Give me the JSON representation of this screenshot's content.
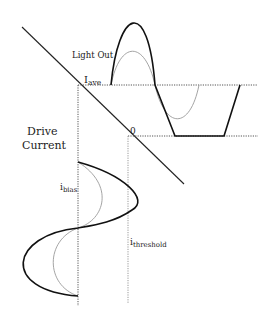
{
  "diagram": {
    "labels": {
      "light_out": "Light Out",
      "drive_current_line1": "Drive",
      "drive_current_line2": "Current",
      "i_ave_main": "I",
      "i_ave_sub": "ave",
      "zero": "0",
      "i_bias_main": "i",
      "i_bias_sub": "bias",
      "i_threshold_main": "i",
      "i_threshold_sub": "threshold"
    },
    "elements": [
      "transfer-curve (diagonal L-I characteristic)",
      "light-output waveform (clipped, bold)",
      "light-output waveform (small, thin gray)",
      "drive-current waveform (large, bold)",
      "drive-current waveform (small, thin gray)",
      "I_ave dotted horizontal reference",
      "zero-light dotted horizontal reference",
      "i_bias dotted vertical reference",
      "i_threshold vertical reference"
    ],
    "colors": {
      "bold_line": "#111111",
      "thin_line": "#9a9a9a",
      "dotted": "#555555"
    }
  }
}
